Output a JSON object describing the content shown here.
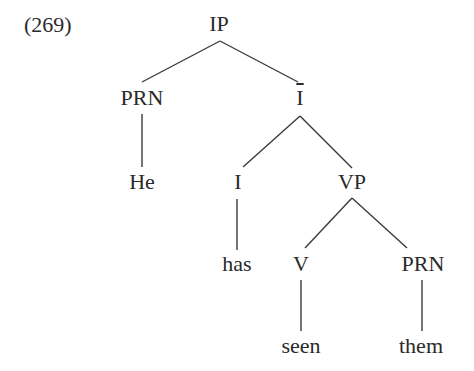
{
  "example": {
    "number": "(269)"
  },
  "tree": {
    "root": "IP",
    "nodes": {
      "ip": {
        "label": "IP",
        "x": 219,
        "y": 11
      },
      "prn_subject": {
        "label": "PRN",
        "x": 142,
        "y": 85
      },
      "i_bar": {
        "label": "I",
        "bar": true,
        "x": 300,
        "y": 85
      },
      "he": {
        "label": "He",
        "x": 142,
        "y": 169
      },
      "i_head": {
        "label": "I",
        "x": 238,
        "y": 169
      },
      "vp": {
        "label": "VP",
        "x": 352,
        "y": 169
      },
      "has": {
        "label": "has",
        "x": 237,
        "y": 251
      },
      "v": {
        "label": "V",
        "x": 301,
        "y": 251
      },
      "prn_object": {
        "label": "PRN",
        "x": 423,
        "y": 251
      },
      "seen": {
        "label": "seen",
        "x": 301,
        "y": 333
      },
      "them": {
        "label": "them",
        "x": 421,
        "y": 333
      }
    },
    "edges": [
      {
        "from": "IP",
        "to": "PRN"
      },
      {
        "from": "IP",
        "to": "Ī"
      },
      {
        "from": "PRN",
        "to": "He"
      },
      {
        "from": "Ī",
        "to": "I"
      },
      {
        "from": "Ī",
        "to": "VP"
      },
      {
        "from": "I",
        "to": "has"
      },
      {
        "from": "VP",
        "to": "V"
      },
      {
        "from": "VP",
        "to": "PRN"
      },
      {
        "from": "V",
        "to": "seen"
      },
      {
        "from": "PRN",
        "to": "them"
      }
    ],
    "sentence": "He has seen them"
  }
}
